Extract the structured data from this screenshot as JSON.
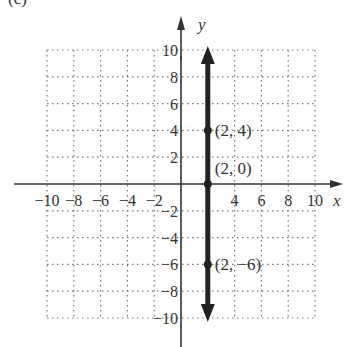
{
  "header": {
    "partial_label": "(c)"
  },
  "chart_data": {
    "type": "line",
    "title": "",
    "xlabel": "x",
    "ylabel": "y",
    "xlim": [
      -10,
      10
    ],
    "ylim": [
      -10,
      10
    ],
    "grid": true,
    "grid_step": 2,
    "x_ticks": [
      "-10",
      "-8",
      "-6",
      "-4",
      "-2",
      "4",
      "6",
      "8",
      "10"
    ],
    "y_ticks": [
      "10",
      "8",
      "6",
      "4",
      "2",
      "-2",
      "-4",
      "-6",
      "-8",
      "-10"
    ],
    "series": [
      {
        "name": "x = 2",
        "kind": "vertical-line",
        "x": 2,
        "arrows": "both"
      }
    ],
    "points": [
      {
        "x": 2,
        "y": 4,
        "label": "(2, 4)"
      },
      {
        "x": 2,
        "y": 0,
        "label": "(2, 0)"
      },
      {
        "x": 2,
        "y": -6,
        "label": "(2, −6)"
      }
    ]
  }
}
